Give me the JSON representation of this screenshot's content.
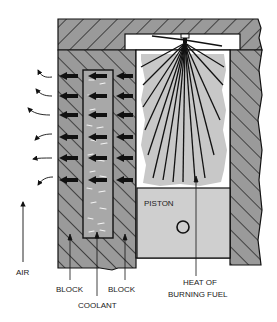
{
  "diagram": {
    "type": "cross-section",
    "colors": {
      "block": "#9a9a9a",
      "hatch": "#1a1a1a",
      "coolant": "#a8a8a8",
      "flame": "#c8c8c8",
      "piston": "#cfcfcf",
      "background": "#ffffff",
      "outline": "#111111"
    },
    "labels": {
      "air": "AIR",
      "block_left": "BLOCK",
      "block_right": "BLOCK",
      "coolant": "COOLANT",
      "heat_line1": "HEAT OF",
      "heat_line2": "BURNING FUEL",
      "piston": "PISTON"
    },
    "heat_arrows_rows": 6,
    "air_curls": 6
  }
}
